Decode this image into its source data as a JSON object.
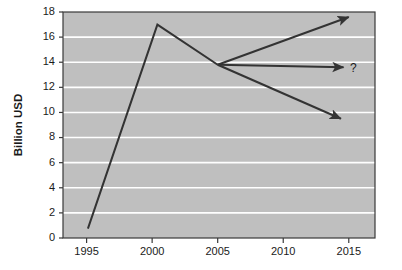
{
  "chart_data": {
    "type": "line",
    "title": "",
    "subtitle": "",
    "xlabel": "",
    "ylabel": "Billion USD",
    "xlim": [
      1993.2,
      2017.0
    ],
    "ylim": [
      0,
      18
    ],
    "grid": true,
    "grid_orientation": "horizontal",
    "legend": "none",
    "plot_background": "#bfbfbf",
    "grid_color": "#ffffff",
    "line_color": "#333333",
    "axis_color": "#3a3a3a",
    "x_ticks": [
      1995,
      2000,
      2005,
      2010,
      2015
    ],
    "x_tick_labels": [
      "1995",
      "2000",
      "2005",
      "2010",
      "2015"
    ],
    "y_ticks": [
      0,
      2,
      4,
      6,
      8,
      10,
      12,
      14,
      16,
      18
    ],
    "y_tick_labels": [
      "0",
      "2",
      "4",
      "6",
      "8",
      "10",
      "12",
      "14",
      "16",
      "18"
    ],
    "series": [
      {
        "name": "historical",
        "type": "line",
        "x": [
          1995.1,
          2000.4,
          2005.0
        ],
        "values": [
          0.75,
          17.0,
          13.8
        ]
      },
      {
        "name": "projection-up",
        "type": "arrow",
        "x": [
          2005.0,
          2015.0
        ],
        "values": [
          13.8,
          17.6
        ]
      },
      {
        "name": "projection-flat",
        "type": "arrow",
        "x": [
          2005.0,
          2014.6
        ],
        "values": [
          13.8,
          13.6
        ]
      },
      {
        "name": "projection-down",
        "type": "arrow",
        "x": [
          2005.0,
          2014.4
        ],
        "values": [
          13.8,
          9.5
        ]
      }
    ],
    "annotations": [
      {
        "text": "?",
        "x": 2015.1,
        "y": 13.5
      }
    ]
  }
}
